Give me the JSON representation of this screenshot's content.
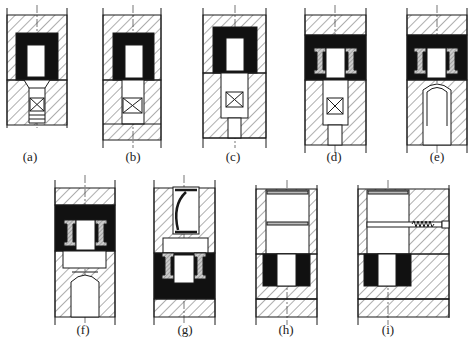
{
  "figure": {
    "panels": [
      {
        "id": "a",
        "label": "(a)",
        "x": 30,
        "y": 157
      },
      {
        "id": "b",
        "label": "(b)",
        "x": 133,
        "y": 157
      },
      {
        "id": "c",
        "label": "(c)",
        "x": 233,
        "y": 157
      },
      {
        "id": "d",
        "label": "(d)",
        "x": 334,
        "y": 157
      },
      {
        "id": "e",
        "label": "(e)",
        "x": 437,
        "y": 157
      },
      {
        "id": "f",
        "label": "(f)",
        "x": 83,
        "y": 330
      },
      {
        "id": "g",
        "label": "(g)",
        "x": 185,
        "y": 330
      },
      {
        "id": "h",
        "label": "(h)",
        "x": 286,
        "y": 330
      },
      {
        "id": "i",
        "label": "(i)",
        "x": 388,
        "y": 330
      }
    ],
    "caption": ""
  },
  "colors": {
    "ink": "#1a1a1a",
    "fill": "#111111",
    "hatch": "#333333",
    "paper": "#ffffff"
  }
}
